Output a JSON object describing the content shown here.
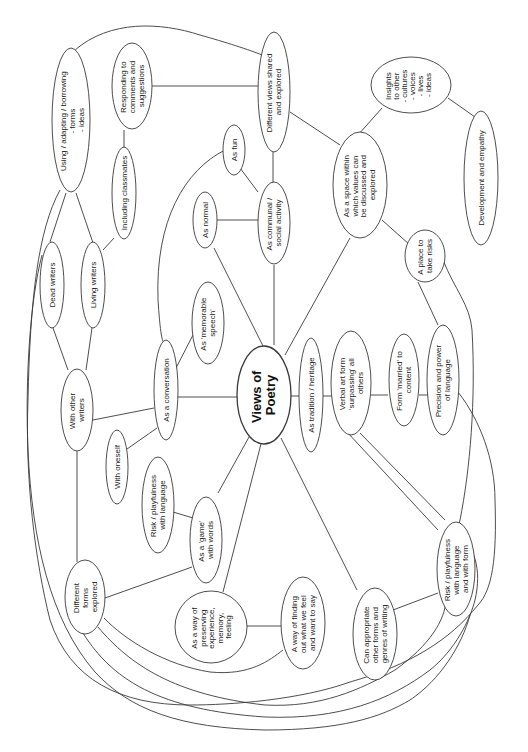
{
  "diagram": {
    "title": "Views of Poetry",
    "orientation": "rotated-90-ccw",
    "colors": {
      "stroke": "#3a3a3a",
      "fill": "#ffffff",
      "text": "#222222"
    },
    "nodes": {
      "center": {
        "lines": [
          "Views of",
          "Poetry"
        ]
      },
      "using_adapting": {
        "lines": [
          "Using / adapting / borrowing",
          "- forms",
          "- ideas"
        ]
      },
      "responding": {
        "lines": [
          "Responding to",
          "comments and",
          "suggestions"
        ]
      },
      "different_views": {
        "lines": [
          "Different views shared",
          "and explored"
        ]
      },
      "insights": {
        "lines": [
          "Insights",
          "to other",
          "- cultures",
          "- voices",
          "- lives",
          "- ideas"
        ]
      },
      "development_empathy": {
        "lines": [
          "Development and empathy"
        ]
      },
      "including_classmates": {
        "lines": [
          "Including classmates"
        ]
      },
      "as_fun": {
        "lines": [
          "As fun"
        ]
      },
      "as_normal": {
        "lines": [
          "As normal"
        ]
      },
      "communal": {
        "lines": [
          "As communal /",
          "social activity"
        ]
      },
      "space_values": {
        "lines": [
          "As a space within",
          "which values can",
          "be discussed and",
          "explored"
        ]
      },
      "place_risks": {
        "lines": [
          "A place to",
          "take risks"
        ]
      },
      "dead_writers": {
        "lines": [
          "Dead writers"
        ]
      },
      "living_writers": {
        "lines": [
          "Living writers"
        ]
      },
      "memorable_speech": {
        "lines": [
          "As 'memorable",
          "speech'"
        ]
      },
      "with_other_writers": {
        "lines": [
          "With other",
          "writers"
        ]
      },
      "as_conversation": {
        "lines": [
          "As a conversation"
        ]
      },
      "tradition": {
        "lines": [
          "As tradition / heritage"
        ]
      },
      "verbal_art": {
        "lines": [
          "Verbal art form",
          "'surpassing' all",
          "others"
        ]
      },
      "form_married": {
        "lines": [
          "Form 'married' to",
          "content"
        ]
      },
      "precision_power": {
        "lines": [
          "Precision and power",
          "of language"
        ]
      },
      "with_oneself": {
        "lines": [
          "With oneself"
        ]
      },
      "risk_language": {
        "lines": [
          "Risk / playfulness",
          "with language"
        ]
      },
      "game_words": {
        "lines": [
          "As a 'game'",
          "with words"
        ]
      },
      "different_forms": {
        "lines": [
          "Different",
          "forms",
          "explored"
        ]
      },
      "preserving": {
        "lines": [
          "As a way of",
          "preserving",
          "experience,",
          "memory,",
          "feeling"
        ]
      },
      "finding_out": {
        "lines": [
          "A way of finding",
          "out what we feel",
          "and want to say"
        ]
      },
      "appropriate": {
        "lines": [
          "Can appropriate",
          "other forms and",
          "genres of writing"
        ]
      },
      "risk_form": {
        "lines": [
          "Risk / playfulness",
          "with language",
          "and with form"
        ]
      }
    }
  }
}
